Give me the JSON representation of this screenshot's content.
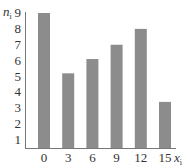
{
  "chart_data": {
    "type": "bar",
    "title": "",
    "xlabel": "x_i",
    "ylabel": "n_i",
    "categories": [
      "0",
      "3",
      "6",
      "9",
      "12",
      "15"
    ],
    "values": [
      9,
      5.2,
      6.1,
      7,
      8,
      3.4
    ],
    "yticks": [
      "1",
      "2",
      "3",
      "4",
      "5",
      "6",
      "7",
      "8",
      "9"
    ],
    "ylim": [
      0.5,
      9
    ],
    "grid": false,
    "legend": null,
    "bar_color": "#8c8c8c"
  },
  "labels": {
    "y_main": "n",
    "y_sub": "i",
    "x_main": "x",
    "x_sub": "i"
  }
}
